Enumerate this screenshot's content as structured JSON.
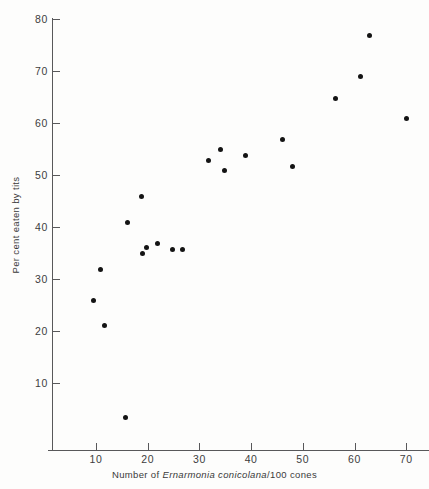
{
  "chart_data": {
    "type": "scatter",
    "title": "",
    "subtitle": "",
    "xlabel_parts": {
      "before": "Number of ",
      "species": "Ernarmonia conicolana",
      "after": "/100 cones"
    },
    "xlabel": "Number of Ernarmonia conicolana/100 cones",
    "ylabel": "Per cent eaten by tits",
    "xlim": [
      4,
      73
    ],
    "ylim": [
      0,
      80
    ],
    "xticks": [
      10,
      20,
      30,
      40,
      50,
      60,
      70
    ],
    "yticks": [
      10,
      20,
      30,
      40,
      50,
      60,
      70,
      80
    ],
    "xtick_labels": [
      "10",
      "20",
      "30",
      "40",
      "50",
      "60",
      "70"
    ],
    "ytick_labels": [
      "10",
      "20",
      "30",
      "40",
      "50",
      "60",
      "70",
      "80"
    ],
    "grid": false,
    "legend": null,
    "marker": "filled-circle",
    "marker_color": "#141414",
    "marker_size_px": 5,
    "axis_color": "#58585a",
    "background_color": "#fdfdfc",
    "points": [
      {
        "x": 9.6,
        "y": 25.9
      },
      {
        "x": 10.8,
        "y": 31.9
      },
      {
        "x": 11.7,
        "y": 21.0
      },
      {
        "x": 15.7,
        "y": 3.3
      },
      {
        "x": 16.0,
        "y": 40.8
      },
      {
        "x": 18.7,
        "y": 45.9
      },
      {
        "x": 18.9,
        "y": 34.9
      },
      {
        "x": 19.8,
        "y": 36.0
      },
      {
        "x": 21.8,
        "y": 36.9
      },
      {
        "x": 24.8,
        "y": 35.6
      },
      {
        "x": 26.7,
        "y": 35.6
      },
      {
        "x": 31.7,
        "y": 52.8
      },
      {
        "x": 34.0,
        "y": 54.9
      },
      {
        "x": 34.8,
        "y": 50.8
      },
      {
        "x": 39.0,
        "y": 53.8
      },
      {
        "x": 46.1,
        "y": 56.9
      },
      {
        "x": 48.0,
        "y": 51.7
      },
      {
        "x": 56.3,
        "y": 64.7
      },
      {
        "x": 61.1,
        "y": 68.9
      },
      {
        "x": 62.9,
        "y": 76.8
      },
      {
        "x": 70.0,
        "y": 60.8
      }
    ]
  }
}
